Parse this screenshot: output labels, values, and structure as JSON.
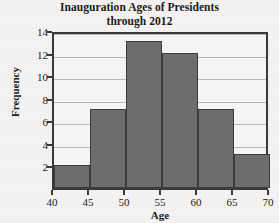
{
  "chart_data": {
    "type": "bar",
    "title": "Inauguration Ages of Presidents through 2012",
    "title_lines": [
      "Inauguration Ages of Presidents",
      "through 2012"
    ],
    "xlabel": "Age",
    "ylabel": "Frequency",
    "categories": [
      "40-45",
      "45-50",
      "50-55",
      "55-60",
      "60-65",
      "65-70"
    ],
    "bin_starts": [
      40,
      45,
      50,
      55,
      60,
      65
    ],
    "bin_width": 5,
    "values": [
      2,
      7,
      13,
      12,
      7,
      3
    ],
    "xlim": [
      40,
      70
    ],
    "ylim": [
      0,
      14
    ],
    "xticks": [
      40,
      45,
      50,
      55,
      60,
      65,
      70
    ],
    "xtick_labels": [
      "40",
      "45",
      "50",
      "55",
      "60",
      "65",
      "70"
    ],
    "yticks": [
      2,
      4,
      6,
      8,
      10,
      12,
      14
    ],
    "ytick_labels": [
      "2",
      "4",
      "6",
      "8",
      "10",
      "12",
      "14"
    ],
    "grid": "horizontal",
    "legend": "none",
    "colors": {
      "bar_fill": "#6e6e6e",
      "bar_edge": "#3c3c3c",
      "axis": "#3a3a3a",
      "gridline": "#b9b9b7",
      "plot_background": "#f7f6f4",
      "figure_background": "#f4f3f1",
      "text": "#1b1b1b"
    }
  }
}
